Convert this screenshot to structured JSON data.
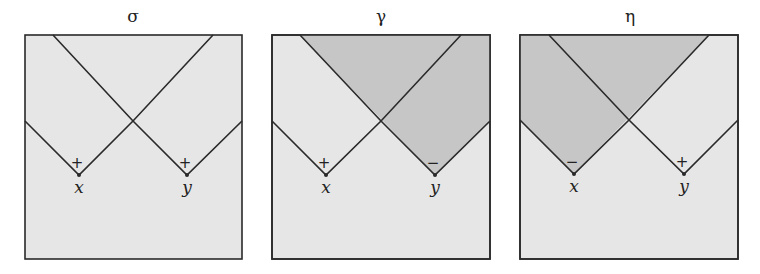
{
  "colors": {
    "background": "#e6e6e6",
    "shaded": "#c6c6c6",
    "line": "#2a2a2a"
  },
  "panels": [
    {
      "title": "σ",
      "points": [
        {
          "label": "x",
          "sign": "+"
        },
        {
          "label": "y",
          "sign": "+"
        }
      ],
      "shaded_region": "none"
    },
    {
      "title": "γ",
      "points": [
        {
          "label": "x",
          "sign": "+"
        },
        {
          "label": "y",
          "sign": "−"
        }
      ],
      "shaded_region": "future cone of y"
    },
    {
      "title": "η",
      "points": [
        {
          "label": "x",
          "sign": "−"
        },
        {
          "label": "y",
          "sign": "+"
        }
      ],
      "shaded_region": "future cone of x"
    }
  ]
}
